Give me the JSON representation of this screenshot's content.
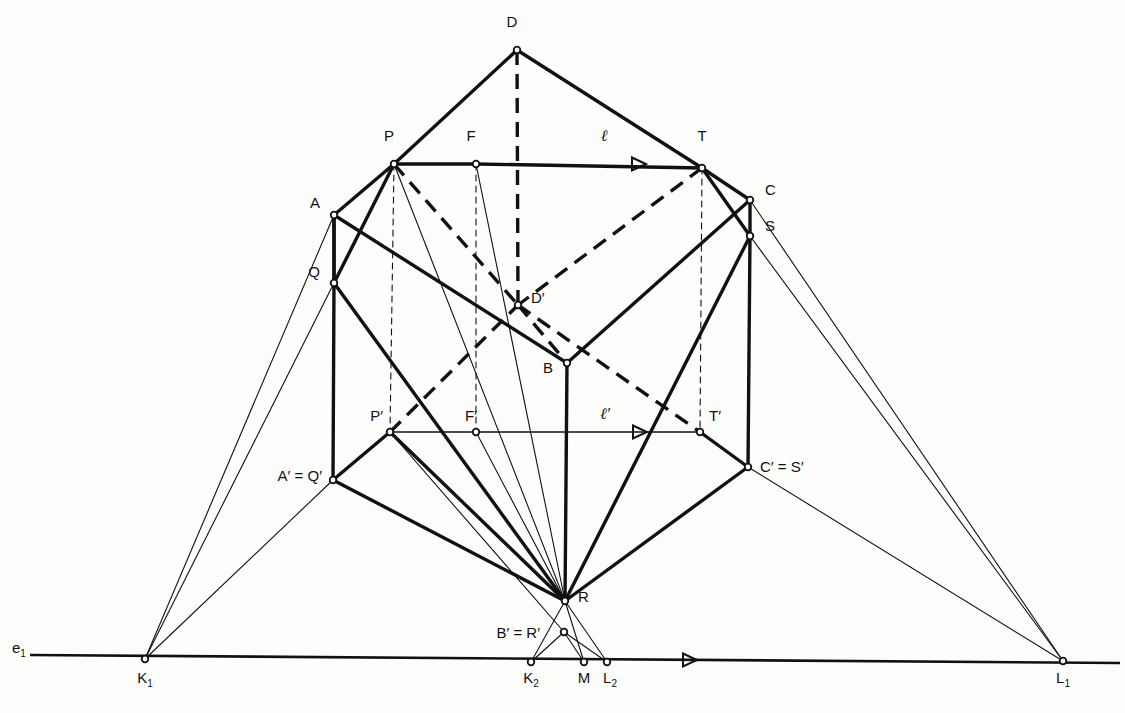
{
  "figure": {
    "background": "#fdfdfb",
    "ink": "#111111",
    "width": 1125,
    "height": 713
  },
  "labels": [
    {
      "name": "label-D",
      "text": "D",
      "x": 512,
      "y": 22,
      "anchor": "middle"
    },
    {
      "name": "label-P",
      "text": "P",
      "x": 389,
      "y": 136,
      "anchor": "middle"
    },
    {
      "name": "label-F",
      "text": "F",
      "x": 471,
      "y": 136,
      "anchor": "middle"
    },
    {
      "name": "label-l",
      "text": "ℓ",
      "x": 604,
      "y": 136,
      "anchor": "middle",
      "italic": true
    },
    {
      "name": "label-T",
      "text": "T",
      "x": 702,
      "y": 136,
      "anchor": "middle"
    },
    {
      "name": "label-C",
      "text": "C",
      "x": 765,
      "y": 190,
      "anchor": "start"
    },
    {
      "name": "label-A",
      "text": "A",
      "x": 320,
      "y": 203,
      "anchor": "end"
    },
    {
      "name": "label-S",
      "text": "S",
      "x": 765,
      "y": 226,
      "anchor": "start"
    },
    {
      "name": "label-Q",
      "text": "Q",
      "x": 320,
      "y": 272,
      "anchor": "end"
    },
    {
      "name": "label-Dprime",
      "text": "D′",
      "x": 531,
      "y": 298,
      "anchor": "start"
    },
    {
      "name": "label-B",
      "text": "B",
      "x": 553,
      "y": 368,
      "anchor": "end"
    },
    {
      "name": "label-Pprime",
      "text": "P′",
      "x": 383,
      "y": 416,
      "anchor": "end"
    },
    {
      "name": "label-Fprime",
      "text": "F′",
      "x": 471,
      "y": 416,
      "anchor": "middle"
    },
    {
      "name": "label-lprime",
      "text": "ℓ′",
      "x": 605,
      "y": 414,
      "anchor": "middle",
      "italic": true
    },
    {
      "name": "label-Tprime",
      "text": "T′",
      "x": 709,
      "y": 416,
      "anchor": "start"
    },
    {
      "name": "label-CprimeSprime",
      "text": "C′ = S′",
      "x": 760,
      "y": 467,
      "anchor": "start"
    },
    {
      "name": "label-AprimeQprime",
      "text": "A′ = Q′",
      "x": 322,
      "y": 476,
      "anchor": "end"
    },
    {
      "name": "label-R",
      "text": "R",
      "x": 578,
      "y": 597,
      "anchor": "start"
    },
    {
      "name": "label-BprimeRprime",
      "text": "B′ = R′",
      "x": 540,
      "y": 633,
      "anchor": "end"
    },
    {
      "name": "label-e1",
      "text": "e",
      "sub": "1",
      "x": 12,
      "y": 648,
      "anchor": "start"
    },
    {
      "name": "label-K1",
      "text": "K",
      "sub": "1",
      "x": 145,
      "y": 678,
      "anchor": "middle"
    },
    {
      "name": "label-K2",
      "text": "K",
      "sub": "2",
      "x": 531,
      "y": 678,
      "anchor": "middle"
    },
    {
      "name": "label-M",
      "text": "M",
      "x": 584,
      "y": 678,
      "anchor": "middle"
    },
    {
      "name": "label-L2",
      "text": "L",
      "sub": "2",
      "x": 610,
      "y": 678,
      "anchor": "middle"
    },
    {
      "name": "label-L1",
      "text": "L",
      "sub": "1",
      "x": 1063,
      "y": 678,
      "anchor": "middle"
    }
  ],
  "points": [
    {
      "name": "point-D",
      "id": "D",
      "x": 517,
      "y": 50
    },
    {
      "name": "point-P",
      "id": "P",
      "x": 394,
      "y": 164
    },
    {
      "name": "point-F",
      "id": "F",
      "x": 476,
      "y": 164
    },
    {
      "name": "point-T",
      "id": "T",
      "x": 702,
      "y": 168
    },
    {
      "name": "point-C",
      "id": "C",
      "x": 750,
      "y": 200
    },
    {
      "name": "point-A",
      "id": "A",
      "x": 334,
      "y": 215
    },
    {
      "name": "point-S",
      "id": "S",
      "x": 750,
      "y": 236
    },
    {
      "name": "point-Q",
      "id": "Q",
      "x": 334,
      "y": 283
    },
    {
      "name": "point-Dprime",
      "id": "D'",
      "x": 518,
      "y": 305
    },
    {
      "name": "point-B",
      "id": "B",
      "x": 567,
      "y": 363
    },
    {
      "name": "point-Pprime",
      "id": "P'",
      "x": 390,
      "y": 432
    },
    {
      "name": "point-Fprime",
      "id": "F'",
      "x": 476,
      "y": 432
    },
    {
      "name": "point-Tprime",
      "id": "T'",
      "x": 700,
      "y": 432
    },
    {
      "name": "point-CprimeSprime",
      "id": "C'=S'",
      "x": 748,
      "y": 467
    },
    {
      "name": "point-AprimeQprime",
      "id": "A'=Q'",
      "x": 333,
      "y": 480
    },
    {
      "name": "point-R",
      "id": "R",
      "x": 565,
      "y": 601
    },
    {
      "name": "point-BprimeRprime",
      "id": "B'=R'",
      "x": 564,
      "y": 632
    },
    {
      "name": "point-K1",
      "id": "K1",
      "x": 145,
      "y": 659
    },
    {
      "name": "point-K2",
      "id": "K2",
      "x": 531,
      "y": 662
    },
    {
      "name": "point-M",
      "id": "M",
      "x": 584,
      "y": 662
    },
    {
      "name": "point-L2",
      "id": "L2",
      "x": 607,
      "y": 662
    },
    {
      "name": "point-L1",
      "id": "L1",
      "x": 1063,
      "y": 661
    }
  ],
  "edges_heavy": [
    {
      "name": "edge-D-P",
      "from": "D",
      "to": "P"
    },
    {
      "name": "edge-D-T",
      "from": "D",
      "to": "T"
    },
    {
      "name": "edge-P-F",
      "from": "P",
      "to": "F"
    },
    {
      "name": "edge-F-T",
      "from": "F",
      "to": "T"
    },
    {
      "name": "edge-P-A",
      "from": "P",
      "to": "A"
    },
    {
      "name": "edge-P-Q",
      "from": "P",
      "to": "Q"
    },
    {
      "name": "edge-A-Q",
      "from": "A",
      "to": "Q"
    },
    {
      "name": "edge-T-C",
      "from": "T",
      "to": "C"
    },
    {
      "name": "edge-T-S",
      "from": "T",
      "to": "S"
    },
    {
      "name": "edge-C-S",
      "from": "C",
      "to": "S"
    },
    {
      "name": "edge-A-B",
      "from": "A",
      "to": "B"
    },
    {
      "name": "edge-C-B",
      "from": "C",
      "to": "B"
    },
    {
      "name": "edge-Q-R",
      "from": "Q",
      "to": "R"
    },
    {
      "name": "edge-S-R",
      "from": "S",
      "to": "R"
    },
    {
      "name": "edge-B-R",
      "from": "B",
      "to": "R"
    },
    {
      "name": "edge-Pprime-AprimeQprime",
      "from": "P'",
      "to": "A'=Q'"
    },
    {
      "name": "edge-Tprime-CprimeSprime",
      "from": "T'",
      "to": "C'=S'"
    },
    {
      "name": "edge-AprimeQprime-R",
      "from": "A'=Q'",
      "to": "R"
    },
    {
      "name": "edge-CprimeSprime-R",
      "from": "C'=S'",
      "to": "R"
    },
    {
      "name": "edge-Pprime-R",
      "from": "P'",
      "to": "R"
    },
    {
      "name": "edge-Q-AprimeQprime",
      "from": "Q",
      "to": "A'=Q'"
    },
    {
      "name": "edge-S-CprimeSprime",
      "from": "S",
      "to": "C'=S'"
    },
    {
      "name": "edge-A-Q-vert",
      "from": "A",
      "to": "Q"
    }
  ],
  "edges_hidden_dashed": [
    {
      "name": "hidden-edge-P-Dprime",
      "from": "P",
      "to": "D'"
    },
    {
      "name": "hidden-edge-Dprime-B",
      "from": "D'",
      "to": "B"
    },
    {
      "name": "hidden-edge-T-Dprime",
      "from": "T",
      "to": "D'"
    },
    {
      "name": "hidden-edge-Pprime-Dprime",
      "from": "P'",
      "to": "D'"
    },
    {
      "name": "hidden-edge-Dprime-Tprime",
      "from": "D'",
      "to": "T'"
    },
    {
      "name": "hidden-vertical-D-Dprime",
      "from": "D",
      "to": "D'"
    }
  ],
  "construction_thin": [
    {
      "name": "construction-K1-A",
      "from": "K1",
      "to": "A"
    },
    {
      "name": "construction-K1-Q",
      "from": "K1",
      "to": "Q"
    },
    {
      "name": "construction-K1-AprimeQprime",
      "from": "K1",
      "to": "A'=Q'"
    },
    {
      "name": "construction-L1-C",
      "from": "L1",
      "to": "C"
    },
    {
      "name": "construction-L1-S",
      "from": "L1",
      "to": "S"
    },
    {
      "name": "construction-L1-CprimeSprime",
      "from": "L1",
      "to": "C'=S'"
    },
    {
      "name": "construction-P-R",
      "from": "P",
      "to": "R"
    },
    {
      "name": "construction-F-R",
      "from": "F",
      "to": "R"
    },
    {
      "name": "construction-Fprime-R",
      "from": "F'",
      "to": "R"
    },
    {
      "name": "construction-Pprime-BprimeRprime",
      "from": "P'",
      "to": "B'=R'"
    },
    {
      "name": "construction-K2-R",
      "from": "K2",
      "to": "R"
    },
    {
      "name": "construction-L2-R",
      "from": "L2",
      "to": "R"
    },
    {
      "name": "construction-M-R",
      "from": "M",
      "to": "R"
    },
    {
      "name": "construction-K2-BprimeRprime",
      "from": "K2",
      "to": "B'=R'"
    },
    {
      "name": "construction-L2-BprimeRprime",
      "from": "L2",
      "to": "B'=R'"
    },
    {
      "name": "construction-M-BprimeRprime",
      "from": "M",
      "to": "B'=R'"
    }
  ],
  "axis": {
    "name": "ground-line-e1",
    "label": "e",
    "subscript": "1",
    "x1": 30,
    "y1": 655,
    "x2": 1120,
    "y2": 663
  },
  "arrows": [
    {
      "name": "arrow-line-l",
      "x": 632,
      "y": 164,
      "dir": "right"
    },
    {
      "name": "arrow-line-lprime",
      "x": 633,
      "y": 432,
      "dir": "right"
    },
    {
      "name": "arrow-ground-line",
      "x": 683,
      "y": 660,
      "dir": "right"
    }
  ],
  "vertical_projectors_dashed": [
    {
      "name": "projector-P-Pprime",
      "from": "P",
      "to": "P'"
    },
    {
      "name": "projector-F-Fprime",
      "from": "F",
      "to": "F'"
    },
    {
      "name": "projector-T-Tprime",
      "from": "T",
      "to": "T'"
    }
  ],
  "horizontal_rays": [
    {
      "name": "ray-l",
      "from": "P",
      "to": "T",
      "style": "solid-heavy"
    },
    {
      "name": "ray-lprime",
      "from": "P'",
      "to": "T'",
      "style": "thin"
    }
  ]
}
